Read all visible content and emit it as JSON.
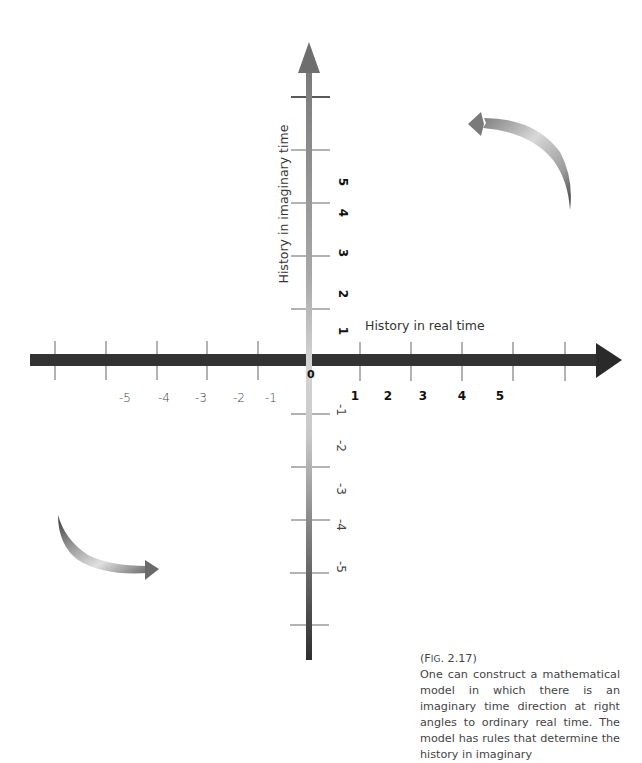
{
  "figure": {
    "label_prefix": "(F",
    "label_smallcaps": "ig",
    "label_suffix": ". 2.17)",
    "caption": "One can construct a mathematical model in which there is an imaginary time direction at right angles to ordinary real time. The model has rules that determine the history in imaginary"
  },
  "axes": {
    "horizontal_title": "History in real time",
    "vertical_title": "History in imaginary time",
    "origin_label": "0",
    "horizontal_negative_labels": [
      "-5",
      "-4",
      "-3",
      "-2",
      "-1"
    ],
    "horizontal_positive_labels": [
      "1",
      "2",
      "3",
      "4",
      "5"
    ],
    "vertical_positive_labels": [
      "5",
      "4",
      "3",
      "2",
      "1"
    ],
    "vertical_negative_labels": [
      "-1",
      "-2",
      "-3",
      "-4",
      "-5"
    ]
  },
  "colors": {
    "horizontal_axis": "#333333",
    "vertical_axis_top": "#7a7a7a",
    "vertical_axis_mid": "#d0d0d0",
    "vertical_axis_bottom": "#333333",
    "tick": "#555555",
    "curved_arrow": "#8a8a8a"
  },
  "icons": {
    "top_right_arrow": "curved-arrow-left-icon",
    "bottom_left_arrow": "curved-arrow-right-icon"
  }
}
